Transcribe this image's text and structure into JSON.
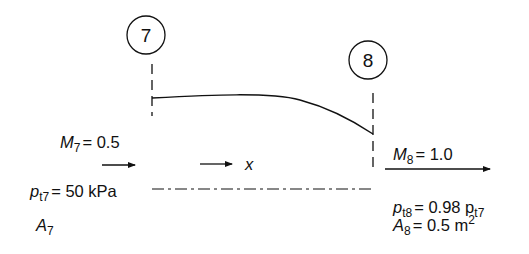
{
  "stations": [
    {
      "id": "7",
      "label": "7"
    },
    {
      "id": "8",
      "label": "8"
    }
  ],
  "axis": {
    "label": "x"
  },
  "inlet": {
    "mach_symbol": "M",
    "mach_sub": "7",
    "mach_value": "= 0.5",
    "pressure_symbol": "p",
    "pressure_sub": "t7",
    "pressure_value": "= 50 kPa",
    "area_symbol": "A",
    "area_sub": "7"
  },
  "outlet": {
    "mach_symbol": "M",
    "mach_sub": "8",
    "mach_value": "= 1.0",
    "pressure_symbol": "p",
    "pressure_sub": "t8",
    "pressure_value": "= 0.98 p",
    "pressure_ref_sub": "t7",
    "area_symbol": "A",
    "area_sub": "8",
    "area_value": "= 0.5 m",
    "area_exp": "2"
  },
  "colors": {
    "stroke": "#111111",
    "background": "#ffffff"
  }
}
